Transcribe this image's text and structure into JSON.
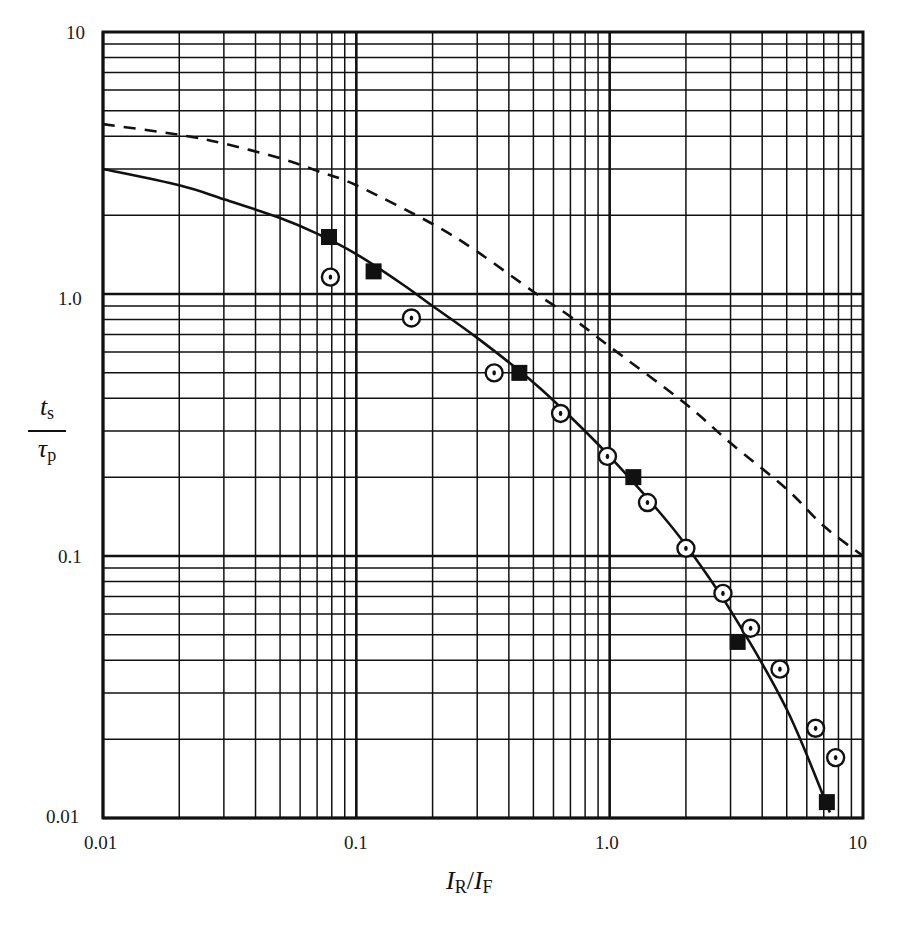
{
  "chart_data": {
    "type": "scatter",
    "title": "",
    "xlabel": "I_R/I_F",
    "ylabel": "t_s/τ_p",
    "xscale": "log",
    "yscale": "log",
    "xlim": [
      0.01,
      10
    ],
    "ylim": [
      0.01,
      10
    ],
    "grid": true,
    "legend": null,
    "x_ticks": [
      "0.01",
      "0.1",
      "1.0",
      "10"
    ],
    "y_ticks": [
      "0.01",
      "0.1",
      "1.0",
      "10"
    ],
    "series": [
      {
        "name": "solid-curve",
        "kind": "line",
        "style": "solid",
        "x": [
          0.01,
          0.02,
          0.03,
          0.05,
          0.07,
          0.1,
          0.15,
          0.2,
          0.3,
          0.5,
          0.7,
          1.0,
          1.5,
          2.0,
          3.0,
          5.0,
          7.4
        ],
        "y": [
          3.0,
          2.6,
          2.3,
          1.95,
          1.7,
          1.42,
          1.1,
          0.9,
          0.68,
          0.46,
          0.34,
          0.24,
          0.155,
          0.11,
          0.062,
          0.026,
          0.0105
        ]
      },
      {
        "name": "dashed-curve",
        "kind": "line",
        "style": "dashed",
        "x": [
          0.01,
          0.02,
          0.03,
          0.05,
          0.07,
          0.1,
          0.2,
          0.3,
          0.5,
          0.7,
          1.0,
          2.0,
          3.0,
          5.0,
          7.0,
          10.0
        ],
        "y": [
          4.45,
          4.05,
          3.75,
          3.3,
          2.95,
          2.6,
          1.85,
          1.45,
          1.02,
          0.82,
          0.63,
          0.38,
          0.27,
          0.18,
          0.13,
          0.1
        ]
      },
      {
        "name": "square-markers",
        "kind": "scatter",
        "marker": "filled-square",
        "x": [
          0.078,
          0.117,
          0.44,
          1.24,
          3.2,
          7.2
        ],
        "y": [
          1.65,
          1.22,
          0.5,
          0.2,
          0.047,
          0.0115
        ]
      },
      {
        "name": "circle-dot-markers",
        "kind": "scatter",
        "marker": "circle-with-dot",
        "x": [
          0.079,
          0.165,
          0.35,
          0.64,
          0.98,
          1.41,
          2.0,
          2.8,
          3.6,
          4.7,
          6.5,
          7.8
        ],
        "y": [
          1.16,
          0.81,
          0.5,
          0.35,
          0.24,
          0.16,
          0.107,
          0.072,
          0.053,
          0.037,
          0.022,
          0.017
        ]
      }
    ]
  },
  "axes": {
    "x_tick_labels": [
      "0.01",
      "0.1",
      "1.0",
      "10"
    ],
    "y_tick_labels": [
      "10",
      "1.0",
      "0.1",
      "0.01"
    ],
    "x_label": {
      "main1": "I",
      "sub1": "R",
      "sep": "/",
      "main2": "I",
      "sub2": "F"
    },
    "y_label": {
      "num_main": "t",
      "num_sub": "s",
      "den_main": "τ",
      "den_sub": "p"
    }
  },
  "colors": {
    "ink": "#111111",
    "background": "#ffffff"
  }
}
